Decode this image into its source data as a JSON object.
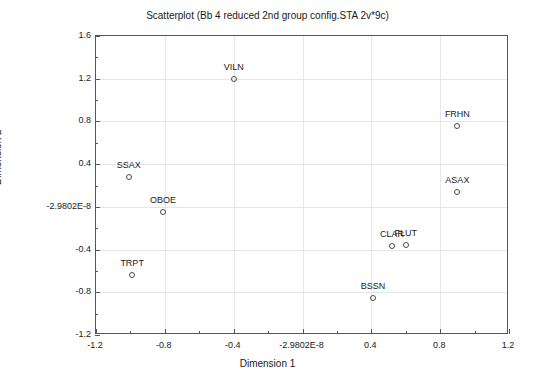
{
  "chart_data": {
    "type": "scatter",
    "title": "Scatterplot (Bb 4 reduced 2nd group config.STA 2v*9c)",
    "xlabel": "Dimension 1",
    "ylabel": "Dimension 2",
    "xlim": [
      -1.2,
      1.2
    ],
    "ylim": [
      -1.2,
      1.6
    ],
    "grid": true,
    "legend": "none",
    "xticks": [
      "-1.2",
      "-0.8",
      "-0.4",
      "-2.9802E-8",
      "0.4",
      "0.8",
      "1.2"
    ],
    "xtick_values": [
      -1.2,
      -0.8,
      -0.4,
      0,
      0.4,
      0.8,
      1.2
    ],
    "yticks": [
      "1.6",
      "1.2",
      "0.8",
      "0.4",
      "-2.9802E-8",
      "-0.4",
      "-0.8",
      "-1.2"
    ],
    "ytick_values": [
      1.6,
      1.2,
      0.8,
      0.4,
      0,
      -0.4,
      -0.8,
      -1.2
    ],
    "points": [
      {
        "label": "VILN",
        "x": -0.4,
        "y": 1.2,
        "label_dx": 0,
        "label_dy": -9
      },
      {
        "label": "FRHN",
        "x": 0.9,
        "y": 0.76,
        "label_dx": 0,
        "label_dy": -9
      },
      {
        "label": "SSAX",
        "x": -1.01,
        "y": 0.28,
        "label_dx": 0,
        "label_dy": -9
      },
      {
        "label": "ASAX",
        "x": 0.9,
        "y": 0.14,
        "label_dx": 0,
        "label_dy": -9
      },
      {
        "label": "OBOE",
        "x": -0.81,
        "y": -0.05,
        "label_dx": 0,
        "label_dy": -9
      },
      {
        "label": "CLAR",
        "x": 0.52,
        "y": -0.37,
        "label_dx": 0,
        "label_dy": -9
      },
      {
        "label": "FLUT",
        "x": 0.6,
        "y": -0.36,
        "label_dx": 0,
        "label_dy": -9
      },
      {
        "label": "TRPT",
        "x": -0.99,
        "y": -0.64,
        "label_dx": 0,
        "label_dy": -9
      },
      {
        "label": "BSSN",
        "x": 0.41,
        "y": -0.85,
        "label_dx": 0,
        "label_dy": -9
      }
    ]
  }
}
